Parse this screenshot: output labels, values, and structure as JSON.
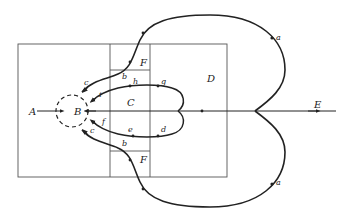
{
  "diagram": {
    "regions": {
      "A": "A",
      "B": "B",
      "C": "C",
      "D": "D",
      "E": "E",
      "F_top": "F",
      "F_bottom": "F"
    },
    "points": {
      "a_top": "a",
      "a_bottom": "a",
      "b_top": "b",
      "b_bottom": "b",
      "c_top": "c",
      "c_bottom": "c",
      "d": "d",
      "e": "e",
      "f": "f",
      "g": "g",
      "h": "h",
      "i": "i"
    },
    "colors": {
      "line": "#222222",
      "background": "#ffffff"
    }
  }
}
